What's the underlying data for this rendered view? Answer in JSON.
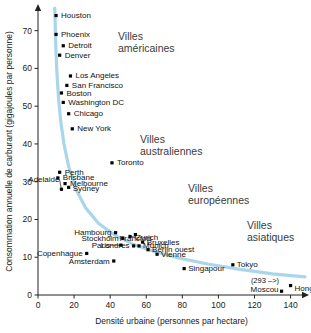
{
  "chart_data": {
    "type": "scatter",
    "title": "",
    "xlabel": "Densité urbaine (personnes par hectare)",
    "ylabel": "Consommation annuelle de carburant (gigajoules par personne)",
    "xlim": [
      0,
      148
    ],
    "ylim": [
      0,
      76
    ],
    "xticks": [
      0,
      20,
      40,
      60,
      80,
      100,
      120,
      140
    ],
    "yticks": [
      0,
      10,
      20,
      30,
      40,
      50,
      60,
      70
    ],
    "grid": false,
    "legend": "none",
    "curve_color": "#a9d6ea",
    "point_color": "#000000",
    "points": [
      {
        "name": "Houston",
        "x": 10,
        "y": 74,
        "label_dx": 5,
        "label_dy": 2.5,
        "anchor": "start"
      },
      {
        "name": "Phoenix",
        "x": 10,
        "y": 69,
        "label_dx": 5,
        "label_dy": 2.5,
        "anchor": "start"
      },
      {
        "name": "Detroit",
        "x": 14,
        "y": 66,
        "label_dx": 5,
        "label_dy": 2.5,
        "anchor": "start"
      },
      {
        "name": "Denver",
        "x": 12,
        "y": 63.5,
        "label_dx": 5,
        "label_dy": 2.5,
        "anchor": "start"
      },
      {
        "name": "Los Angeles",
        "x": 18,
        "y": 58,
        "label_dx": 5,
        "label_dy": 2.5,
        "anchor": "start"
      },
      {
        "name": "San Francisco",
        "x": 16,
        "y": 55.5,
        "label_dx": 5,
        "label_dy": 2.5,
        "anchor": "start"
      },
      {
        "name": "Boston",
        "x": 13,
        "y": 53.5,
        "label_dx": 5,
        "label_dy": 3.0,
        "anchor": "start"
      },
      {
        "name": "Washington DC",
        "x": 14,
        "y": 51,
        "label_dx": 5,
        "label_dy": 2.5,
        "anchor": "start"
      },
      {
        "name": "Chicago",
        "x": 17,
        "y": 48,
        "label_dx": 5,
        "label_dy": 2.5,
        "anchor": "start"
      },
      {
        "name": "New York",
        "x": 19,
        "y": 44,
        "label_dx": 5,
        "label_dy": 2.5,
        "anchor": "start"
      },
      {
        "name": "Toronto",
        "x": 41,
        "y": 35,
        "label_dx": 5,
        "label_dy": 2.5,
        "anchor": "start"
      },
      {
        "name": "Perth",
        "x": 12,
        "y": 32.5,
        "label_dx": 5,
        "label_dy": 2.5,
        "anchor": "start"
      },
      {
        "name": "Brisbane",
        "x": 11,
        "y": 31,
        "label_dx": 5,
        "label_dy": 2.5,
        "anchor": "start"
      },
      {
        "name": "Melbourne",
        "x": 15,
        "y": 29.5,
        "label_dx": 5,
        "label_dy": 2.5,
        "anchor": "start"
      },
      {
        "name": "Sydney",
        "x": 17,
        "y": 28.5,
        "label_dx": 4,
        "label_dy": 3.8,
        "anchor": "start"
      },
      {
        "name": "Adelaide",
        "x": 13,
        "y": 28,
        "label_dx": -2,
        "label_dy": -7.5,
        "anchor": "end",
        "leader": true
      },
      {
        "name": "Francfort",
        "x": 54,
        "y": 16,
        "label_dx": 0,
        "label_dy": 6.5,
        "anchor": "middle",
        "leader": true
      },
      {
        "name": "Zurich",
        "x": 51,
        "y": 15.5,
        "label_dx": 6,
        "label_dy": 3.2,
        "anchor": "start",
        "leader": true
      },
      {
        "name": "Hambourg",
        "x": 43,
        "y": 16.5,
        "label_dx": -4,
        "label_dy": 2.5,
        "anchor": "end"
      },
      {
        "name": "Stockholm",
        "x": 47,
        "y": 15,
        "label_dx": -4,
        "label_dy": 2.5,
        "anchor": "end"
      },
      {
        "name": "Bruxelles",
        "x": 58,
        "y": 14,
        "label_dx": 4,
        "label_dy": 2.5,
        "anchor": "start"
      },
      {
        "name": "Munich",
        "x": 56,
        "y": 13,
        "label_dx": 4,
        "label_dy": 2.2,
        "anchor": "start"
      },
      {
        "name": "Londres",
        "x": 53,
        "y": 13,
        "label_dx": -4,
        "label_dy": 2.5,
        "anchor": "end"
      },
      {
        "name": "Paris",
        "x": 46,
        "y": 13.2,
        "label_dx": -11,
        "label_dy": 2.5,
        "anchor": "end",
        "leader": true
      },
      {
        "name": "Berlin ouest",
        "x": 61,
        "y": 12,
        "label_dx": 4,
        "label_dy": 2.5,
        "anchor": "start"
      },
      {
        "name": "Vienne",
        "x": 66,
        "y": 10.8,
        "label_dx": 4,
        "label_dy": 2.5,
        "anchor": "start"
      },
      {
        "name": "Copenhague",
        "x": 27,
        "y": 11,
        "label_dx": -4,
        "label_dy": 2.5,
        "anchor": "end"
      },
      {
        "name": "Amsterdam",
        "x": 42,
        "y": 9,
        "label_dx": -4,
        "label_dy": 2.5,
        "anchor": "end"
      },
      {
        "name": "Singapour",
        "x": 81,
        "y": 7,
        "label_dx": 4,
        "label_dy": 2.5,
        "anchor": "start"
      },
      {
        "name": "Tokyo",
        "x": 108,
        "y": 8,
        "label_dx": 4,
        "label_dy": 2.5,
        "anchor": "start"
      },
      {
        "name": "Hong Kong",
        "x": 140,
        "y": 2.5,
        "label_dx": 4,
        "label_dy": 5.0,
        "anchor": "start"
      },
      {
        "name": "Moscou",
        "x": 135,
        "y": 1.0,
        "label_dx": -3,
        "label_dy": 0.5,
        "anchor": "end"
      }
    ],
    "curve": [
      [
        9.3,
        76
      ],
      [
        9.6,
        70
      ],
      [
        10.0,
        64
      ],
      [
        10.6,
        58
      ],
      [
        11.4,
        52
      ],
      [
        12.6,
        46
      ],
      [
        14.4,
        40
      ],
      [
        17.0,
        34
      ],
      [
        21.0,
        28
      ],
      [
        26.5,
        23
      ],
      [
        33.5,
        19
      ],
      [
        42.0,
        16
      ],
      [
        52.0,
        13.6
      ],
      [
        64.0,
        11.6
      ],
      [
        78.0,
        9.8
      ],
      [
        94.0,
        8.2
      ],
      [
        112.0,
        6.8
      ],
      [
        130.0,
        5.6
      ],
      [
        148.0,
        4.8
      ]
    ],
    "annotations": [
      {
        "name": "hong-kong-offscale",
        "text": "(293 –>)",
        "x": 118,
        "y": 3.2
      }
    ],
    "region_labels": [
      {
        "name": "villes-americaines",
        "line1": "Villes",
        "line2": "américaines",
        "x": 118,
        "y": 40
      },
      {
        "name": "villes-australiennes",
        "line1": "Villes",
        "line2": "australiennes",
        "x": 140,
        "y": 143
      },
      {
        "name": "villes-europeennes",
        "line1": "Villes",
        "line2": "européennes",
        "x": 188,
        "y": 192
      },
      {
        "name": "villes-asiatiques",
        "line1": "Villes",
        "line2": "asiatiques",
        "x": 247,
        "y": 229
      }
    ]
  }
}
